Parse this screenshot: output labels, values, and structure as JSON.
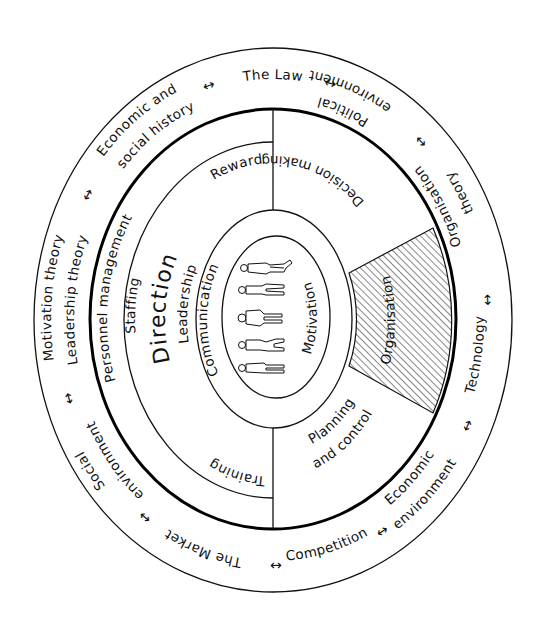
{
  "diagram": {
    "colors": {
      "line": "#111111",
      "background": "#ffffff",
      "hatch": "#222222"
    },
    "outer_ring": {
      "the_law": "The Law",
      "economic_social_history": {
        "line1": "Economic and",
        "line2": "social history"
      },
      "motivation_leadership_theory": {
        "line1": "Motivation theory",
        "line2": "Leadership theory"
      },
      "social_environment": {
        "line1": "Social",
        "line2": "environment"
      },
      "the_market": "The Market",
      "competition": "Competition",
      "economic_environment": {
        "line1": "Economic",
        "line2": "environment"
      },
      "technology": "Technology",
      "organisation_theory": {
        "line1": "Organisation",
        "line2": "theory"
      },
      "political_environment": {
        "line1": "Political",
        "line2": "environment"
      },
      "arrow_glyph": "↔"
    },
    "direction_section": {
      "title": "Direction",
      "personnel_management": "Personnel management",
      "staffing": "Staffing",
      "leadership": "Leadership",
      "reward": "Reward",
      "training": "Training"
    },
    "right_section": {
      "decision_making": "Decision making",
      "organisation": "Organisation",
      "planning_control": {
        "line1": "Planning",
        "line2": "and control"
      }
    },
    "core": {
      "communication": "Communication",
      "motivation": "Motivation",
      "figures_count": 5,
      "figures_icon": "people-figures"
    }
  }
}
